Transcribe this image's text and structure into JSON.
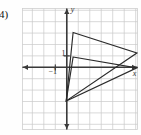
{
  "figure": {
    "problem_number": "4)",
    "axis_labels": {
      "x": "x",
      "y": "y"
    },
    "tick_labels": {
      "y_one": "1",
      "x_negative_one": "−1"
    }
  },
  "chart_data": {
    "type": "line",
    "title": "",
    "xlabel": "x",
    "ylabel": "y",
    "xlim": [
      -3.9,
      6.2
    ],
    "ylim": [
      -5.5,
      5.2
    ],
    "grid": true,
    "grid_step": 1,
    "legend": "none",
    "axes": {
      "x_axis_y": 0,
      "y_axis_x": 0,
      "x_arrow_both_ends": true,
      "y_arrow_both_ends": true
    },
    "annotations": [
      {
        "text": "1",
        "x": -0.45,
        "y": 1.0,
        "role": "y-tick-label"
      },
      {
        "text": "−1",
        "x": -1.6,
        "y": -0.62,
        "role": "x-tick-label"
      },
      {
        "text": "y",
        "x": 0.35,
        "y": 4.85,
        "role": "y-axis-label"
      },
      {
        "text": "x",
        "x": 5.75,
        "y": -0.75,
        "role": "x-axis-label"
      }
    ],
    "series": [
      {
        "name": "outer-triangle",
        "closed": true,
        "points": [
          [
            0.55,
            3.05
          ],
          [
            6.1,
            1.25
          ],
          [
            -0.05,
            -2.95
          ]
        ]
      },
      {
        "name": "inner-triangle",
        "closed": true,
        "points": [
          [
            0.55,
            0.9
          ],
          [
            6.1,
            -0.05
          ],
          [
            -0.05,
            -2.95
          ]
        ]
      }
    ]
  }
}
